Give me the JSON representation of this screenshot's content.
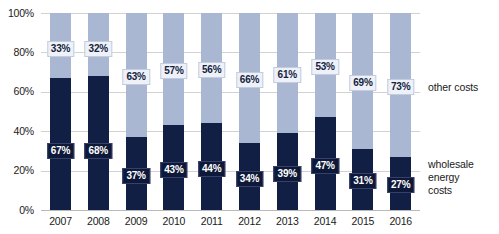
{
  "chart_data": {
    "type": "bar",
    "subtype": "stacked-100-percent",
    "title": "",
    "xlabel": "",
    "ylabel": "",
    "ylim": [
      0,
      100
    ],
    "yticks": [
      "0%",
      "20%",
      "40%",
      "60%",
      "80%",
      "100%"
    ],
    "ytick_values": [
      0,
      20,
      40,
      60,
      80,
      100
    ],
    "grid": true,
    "legend_position": "right",
    "categories": [
      "2007",
      "2008",
      "2009",
      "2010",
      "2011",
      "2012",
      "2013",
      "2014",
      "2015",
      "2016"
    ],
    "series": [
      {
        "name": "wholesale energy costs",
        "color": "#121f45",
        "values": [
          67,
          68,
          37,
          43,
          44,
          34,
          39,
          47,
          31,
          27
        ],
        "labels": [
          "67%",
          "68%",
          "37%",
          "43%",
          "44%",
          "34%",
          "39%",
          "47%",
          "31%",
          "27%"
        ]
      },
      {
        "name": "other costs",
        "color": "#aab7d2",
        "values": [
          33,
          32,
          63,
          57,
          56,
          66,
          61,
          53,
          69,
          73
        ],
        "labels": [
          "33%",
          "32%",
          "63%",
          "57%",
          "56%",
          "66%",
          "61%",
          "53%",
          "69%",
          "73%"
        ]
      }
    ]
  },
  "legend": {
    "other_costs": "other costs",
    "wholesale_line1": "wholesale",
    "wholesale_line2": "energy",
    "wholesale_line3": "costs"
  },
  "colors": {
    "dark_navy": "#121f45",
    "light_blue": "#aab7d2",
    "gridline": "#d2d2d2",
    "text": "#1a1a1a",
    "background": "#ffffff"
  }
}
